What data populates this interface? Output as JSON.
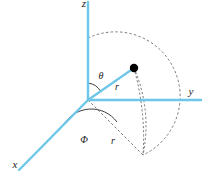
{
  "figure": {
    "background_color": "#ffffff",
    "axis_color": "#6ec6e8",
    "construction_color": "#5a5a5a",
    "point_color": "#000000",
    "label_color": "#1a1a1a",
    "width": 210,
    "height": 173
  },
  "axes": [
    {
      "name": "z-axis",
      "label": "z",
      "label_x": 84,
      "label_y": 7,
      "x1": 88,
      "y1": 2,
      "x2": 88,
      "y2": 100
    },
    {
      "name": "y-axis",
      "label": "y",
      "label_x": 191,
      "label_y": 95,
      "x1": 88,
      "y1": 100,
      "x2": 201,
      "y2": 100
    },
    {
      "name": "x-axis",
      "label": "x",
      "label_x": 15,
      "label_y": 168,
      "x1": 88,
      "y1": 100,
      "x2": 19,
      "y2": 170
    }
  ],
  "point": {
    "name": "plotted-point",
    "x": 134,
    "y": 68,
    "radius": 4.2
  },
  "radial_line": {
    "name": "radius-vector",
    "x1": 88,
    "y1": 100,
    "x2": 134,
    "y2": 68
  },
  "labels": {
    "theta": "θ",
    "phi": "Φ",
    "r_polar": "r",
    "r_azimuth": "r",
    "theta_x": 101,
    "theta_y": 79,
    "phi_x": 84,
    "phi_y": 143,
    "r_polar_x": 117,
    "r_polar_y": 90,
    "r_azimuth_x": 113,
    "r_azimuth_y": 144
  },
  "construction": {
    "polar_arc": "M 88 38 A 62 62 0 0 1 143 155",
    "theta_arc": "M 88 83 A 17 17 0 0 1 101 92",
    "phi_arc": "M 63 126 A 32 32 0 0 1 117 122",
    "ground_projection_line": "M 88 100 L 143 155",
    "vertical_drop_arc": "M 134 68 Q 146 112 143 155",
    "ellipse_edge_arc": "M 134 68 Q 152 110 143 155"
  }
}
